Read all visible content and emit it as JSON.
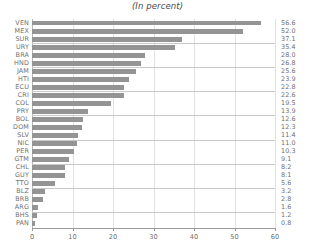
{
  "chart_data": {
    "type": "bar",
    "orientation": "horizontal",
    "title": "(In percent)",
    "xlabel": "",
    "ylabel": "",
    "xlim": [
      0,
      60
    ],
    "ylim": null,
    "grid": true,
    "legend": null,
    "xticks": [
      "0",
      "10",
      "20",
      "30",
      "40",
      "50",
      "60"
    ],
    "xtick_values": [
      0,
      10,
      20,
      30,
      40,
      50,
      60
    ],
    "categories": [
      "VEN",
      "MEX",
      "SUR",
      "URY",
      "BRA",
      "HND",
      "JAM",
      "HTI",
      "ECU",
      "CRI",
      "COL",
      "PRY",
      "BOL",
      "DOM",
      "SLV",
      "NIC",
      "PER",
      "GTM",
      "CHL",
      "GUY",
      "TTO",
      "BLZ",
      "BRB",
      "ARG",
      "BHS",
      "PAN"
    ],
    "values": [
      56.6,
      52.0,
      37.1,
      35.4,
      28.0,
      26.8,
      25.6,
      23.9,
      22.8,
      22.6,
      19.5,
      13.9,
      12.6,
      12.3,
      11.4,
      11.0,
      10.3,
      9.1,
      8.2,
      8.1,
      5.6,
      3.2,
      2.8,
      1.6,
      1.2,
      0.8
    ],
    "value_labels": [
      "56.6",
      "52.0",
      "37.1",
      "35.4",
      "28.0",
      "26.8",
      "25.6",
      "23.9",
      "22.8",
      "22.6",
      "19.5",
      "13.9",
      "12.6",
      "12.3",
      "11.4",
      "11.0",
      "10.3",
      "9.1",
      "8.2",
      "8.1",
      "5.6",
      "3.2",
      "2.8",
      "1.6",
      "1.2",
      "0.8"
    ],
    "colors": {
      "bar": "#949494",
      "grid": "#e2e2e2",
      "separator": "#c9c9c9",
      "axis": "#9a9a9a",
      "text": "#6f6f6f",
      "background": "#ffffff"
    },
    "separator_after_rows": [
      3,
      6,
      9,
      12,
      15,
      18,
      21,
      24
    ]
  }
}
